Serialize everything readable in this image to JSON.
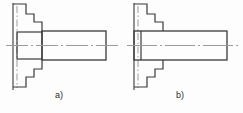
{
  "figure": {
    "canvas": {
      "width": 243,
      "height": 113,
      "background": "#fdfdfd"
    },
    "line_colors": {
      "outline": "#3a3a3a",
      "centerline": "#8a8a8a",
      "axis_vertical": "#8a8a8a",
      "label_text": "#2b2b2b"
    },
    "line_widths": {
      "outline": 1.2,
      "thick_outline": 1.6,
      "centerline": 1.0
    },
    "subfigures": [
      {
        "id": "a",
        "label": "a)",
        "label_position": {
          "x": 55,
          "y": 90
        },
        "description": "stepped shaft with separate shorter left collar section and longer right body",
        "left_datum_line": {
          "x": 13,
          "y1": 3,
          "y2": 90,
          "style": "solid"
        },
        "centerline_vertical": {
          "x": 17,
          "y1": 6,
          "y2": 88,
          "style": "dash-dot"
        },
        "centerline_horizontal": {
          "x1": 6,
          "x2": 118,
          "y": 45,
          "style": "dash-dot"
        },
        "shaft_sections": [
          {
            "name": "left-collar",
            "x1": 17,
            "x2": 42,
            "y_top": 32,
            "y_bottom": 59
          },
          {
            "name": "right-body",
            "x1": 42,
            "x2": 106,
            "y_top": 31,
            "y_bottom": 60
          }
        ],
        "step_profile_top": [
          [
            13,
            4
          ],
          [
            26,
            4
          ],
          [
            26,
            14
          ],
          [
            34,
            14
          ],
          [
            34,
            22
          ],
          [
            42,
            22
          ],
          [
            42,
            32
          ]
        ],
        "step_profile_bottom": [
          [
            13,
            87
          ],
          [
            26,
            87
          ],
          [
            26,
            77
          ],
          [
            34,
            77
          ],
          [
            34,
            69
          ],
          [
            42,
            69
          ],
          [
            42,
            59
          ]
        ]
      },
      {
        "id": "b",
        "label": "b)",
        "label_position": {
          "x": 176,
          "y": 90
        },
        "description": "stepped shaft with single continuous full-height body and thin parting line near left end",
        "left_datum_line": {
          "x": 134,
          "y1": 3,
          "y2": 90,
          "style": "solid"
        },
        "centerline_vertical": {
          "x": 138,
          "y1": 6,
          "y2": 88,
          "style": "dash-dot"
        },
        "centerline_horizontal": {
          "x1": 127,
          "x2": 239,
          "y": 45,
          "style": "dash-dot"
        },
        "shaft_sections": [
          {
            "name": "parting-stub",
            "x1": 134,
            "x2": 141,
            "y_top": 31,
            "y_bottom": 60
          },
          {
            "name": "main-body",
            "x1": 141,
            "x2": 227,
            "y_top": 31,
            "y_bottom": 60
          }
        ],
        "step_profile_top": [
          [
            134,
            4
          ],
          [
            147,
            4
          ],
          [
            147,
            14
          ],
          [
            155,
            14
          ],
          [
            155,
            22
          ],
          [
            163,
            22
          ],
          [
            163,
            31
          ]
        ],
        "step_profile_bottom": [
          [
            134,
            87
          ],
          [
            147,
            87
          ],
          [
            147,
            77
          ],
          [
            155,
            77
          ],
          [
            155,
            69
          ],
          [
            163,
            69
          ],
          [
            163,
            60
          ]
        ]
      }
    ]
  }
}
